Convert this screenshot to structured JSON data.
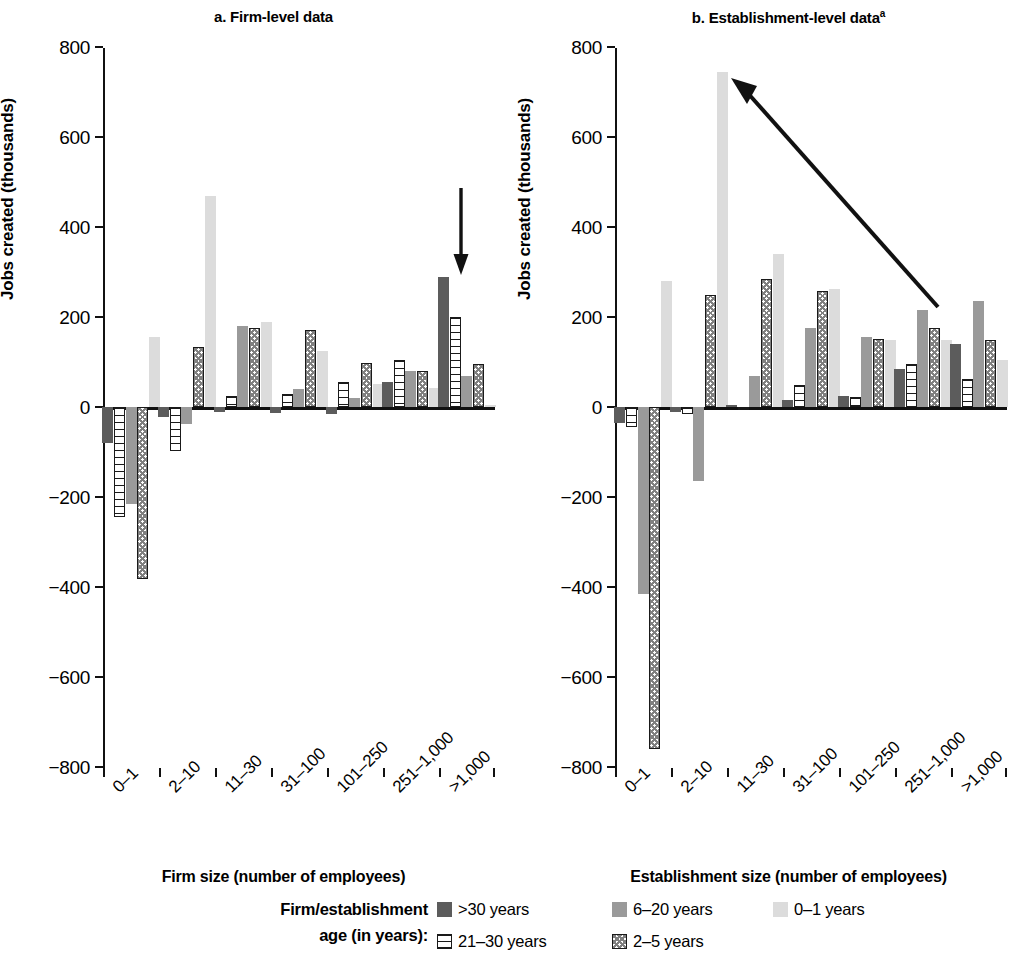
{
  "panels": [
    {
      "id": "a",
      "title": "a. Firm-level data",
      "title_sup": "",
      "xtitle": "Firm size (number of employees)",
      "ytitle": "Jobs created (thousands)",
      "annotation": "down-arrow"
    },
    {
      "id": "b",
      "title": "b. Establishment-level data",
      "title_sup": "a",
      "xtitle": "Establishment size (number of employees)",
      "ytitle": "Jobs created (thousands)",
      "annotation": "diagonal-arrow"
    }
  ],
  "legend": {
    "title_line1": "Firm/establishment",
    "title_line2": "age (in years):",
    "items": [
      {
        "label": ">30 years",
        "series": "gt30",
        "color": "#5c5c5c",
        "pattern": "solid-dark"
      },
      {
        "label": "6–20 years",
        "series": "y6_20",
        "color": "#9a9a9a",
        "pattern": "solid-gray"
      },
      {
        "label": "0–1 years",
        "series": "y0_1",
        "color": "#dcdcdc",
        "pattern": "solid-light"
      },
      {
        "label": "21–30 years",
        "series": "y21_30",
        "color": "#ffffff",
        "pattern": "horizontal-lines"
      },
      {
        "label": "2–5 years",
        "series": "y2_5",
        "color": "#ffffff",
        "pattern": "checkerboard"
      }
    ]
  },
  "chart_data": [
    {
      "type": "bar",
      "title": "a. Firm-level data",
      "xlabel": "Firm size (number of employees)",
      "ylabel": "Jobs created (thousands)",
      "ylim": [
        -800,
        800
      ],
      "yticks": [
        800,
        600,
        400,
        200,
        0,
        -200,
        -400,
        -600,
        -800
      ],
      "ytick_labels": [
        "800",
        "600",
        "400",
        "200",
        "0",
        "−200",
        "−400",
        "−600",
        "−800"
      ],
      "grid": false,
      "legend_position": "bottom",
      "categories": [
        "0–1",
        "2–10",
        "11–30",
        "31–100",
        "101–250",
        "251–1,000",
        ">1,000"
      ],
      "series": [
        {
          "name": ">30 years",
          "values": [
            -80,
            -22,
            -12,
            -14,
            -16,
            55,
            290
          ]
        },
        {
          "name": "21–30 years",
          "values": [
            -245,
            -97,
            25,
            30,
            55,
            105,
            200
          ]
        },
        {
          "name": "6–20 years",
          "values": [
            -215,
            -38,
            180,
            40,
            20,
            80,
            68
          ]
        },
        {
          "name": "2–5 years",
          "values": [
            -383,
            133,
            175,
            172,
            98,
            80,
            95
          ]
        },
        {
          "name": "0–1 years",
          "values": [
            155,
            470,
            190,
            125,
            52,
            42,
            5
          ]
        }
      ]
    },
    {
      "type": "bar",
      "title": "b. Establishment-level data",
      "title_footnote": "a",
      "xlabel": "Establishment size (number of employees)",
      "ylabel": "Jobs created (thousands)",
      "ylim": [
        -800,
        800
      ],
      "yticks": [
        800,
        600,
        400,
        200,
        0,
        -200,
        -400,
        -600,
        -800
      ],
      "ytick_labels": [
        "800",
        "600",
        "400",
        "200",
        "0",
        "−200",
        "−400",
        "−600",
        "−800"
      ],
      "grid": false,
      "legend_position": "bottom",
      "categories": [
        "0–1",
        "2–10",
        "11–30",
        "31–100",
        "101–250",
        "251–1,000",
        ">1,000"
      ],
      "series": [
        {
          "name": ">30 years",
          "values": [
            -35,
            -10,
            5,
            15,
            25,
            85,
            140
          ]
        },
        {
          "name": "21–30 years",
          "values": [
            -45,
            -15,
            -6,
            50,
            22,
            95,
            62
          ]
        },
        {
          "name": "6–20 years",
          "values": [
            -415,
            -165,
            70,
            175,
            155,
            215,
            235
          ]
        },
        {
          "name": "2–5 years",
          "values": [
            -760,
            250,
            285,
            258,
            152,
            175,
            150
          ]
        },
        {
          "name": "0–1 years",
          "values": [
            280,
            745,
            340,
            262,
            148,
            148,
            105
          ]
        }
      ]
    }
  ]
}
